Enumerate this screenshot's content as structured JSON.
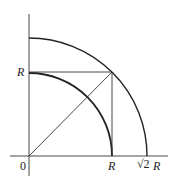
{
  "diagram": {
    "colors": {
      "stroke": "#222222",
      "background": "#ffffff"
    },
    "origin_label": "0",
    "x_axis_labels": {
      "r": "R",
      "sqrt2r_root": "√2",
      "sqrt2r_var": "R"
    },
    "y_axis_labels": {
      "r": "R"
    }
  }
}
